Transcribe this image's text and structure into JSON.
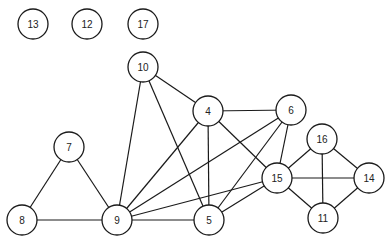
{
  "diagram": {
    "type": "undirected-graph",
    "node_radius": 15,
    "nodes": [
      {
        "id": "13",
        "label": "13",
        "x": 33,
        "y": 24
      },
      {
        "id": "12",
        "label": "12",
        "x": 87,
        "y": 24
      },
      {
        "id": "17",
        "label": "17",
        "x": 143,
        "y": 24
      },
      {
        "id": "10",
        "label": "10",
        "x": 143,
        "y": 67
      },
      {
        "id": "4",
        "label": "4",
        "x": 208,
        "y": 111
      },
      {
        "id": "6",
        "label": "6",
        "x": 291,
        "y": 110
      },
      {
        "id": "7",
        "label": "7",
        "x": 69,
        "y": 147
      },
      {
        "id": "16",
        "label": "16",
        "x": 322,
        "y": 139
      },
      {
        "id": "15",
        "label": "15",
        "x": 277,
        "y": 178
      },
      {
        "id": "14",
        "label": "14",
        "x": 369,
        "y": 178
      },
      {
        "id": "8",
        "label": "8",
        "x": 22,
        "y": 220
      },
      {
        "id": "9",
        "label": "9",
        "x": 117,
        "y": 220
      },
      {
        "id": "5",
        "label": "5",
        "x": 209,
        "y": 220
      },
      {
        "id": "11",
        "label": "11",
        "x": 323,
        "y": 218
      }
    ],
    "edges": [
      [
        "10",
        "4"
      ],
      [
        "10",
        "9"
      ],
      [
        "10",
        "5"
      ],
      [
        "4",
        "6"
      ],
      [
        "4",
        "5"
      ],
      [
        "4",
        "15"
      ],
      [
        "4",
        "9"
      ],
      [
        "6",
        "15"
      ],
      [
        "6",
        "5"
      ],
      [
        "6",
        "9"
      ],
      [
        "7",
        "8"
      ],
      [
        "7",
        "9"
      ],
      [
        "8",
        "9"
      ],
      [
        "9",
        "5"
      ],
      [
        "9",
        "15"
      ],
      [
        "5",
        "15"
      ],
      [
        "15",
        "16"
      ],
      [
        "15",
        "14"
      ],
      [
        "15",
        "11"
      ],
      [
        "16",
        "14"
      ],
      [
        "16",
        "11"
      ],
      [
        "14",
        "11"
      ]
    ]
  }
}
